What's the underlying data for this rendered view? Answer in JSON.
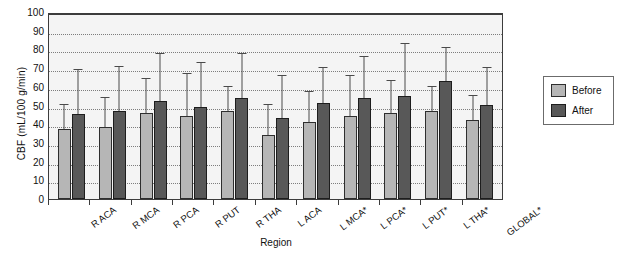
{
  "chart_data": {
    "type": "bar",
    "title": "",
    "xlabel": "Region",
    "ylabel": "CBF (mL/100 g/min)",
    "ylim": [
      0,
      100
    ],
    "ytick_step": 10,
    "yticks": [
      100,
      90,
      80,
      70,
      60,
      50,
      40,
      30,
      20,
      10,
      0
    ],
    "grid": true,
    "legend_position": "right-outside",
    "categories": [
      "R ACA",
      "R MCA",
      "R PCA",
      "R PUT",
      "R THA",
      "L ACA",
      "L MCA*",
      "L PCA*",
      "L PUT*",
      "L THA*",
      "GLOBAL*"
    ],
    "series": [
      {
        "name": "Before",
        "color": "#b6b6b6",
        "values": [
          38,
          39,
          47,
          45,
          48,
          35,
          42,
          45,
          47,
          48,
          43
        ],
        "error_high": [
          51,
          55,
          65,
          68,
          61,
          51,
          58,
          67,
          64,
          61,
          56
        ]
      },
      {
        "name": "After",
        "color": "#585858",
        "values": [
          46,
          48,
          53,
          50,
          55,
          44,
          52,
          55,
          56,
          64,
          51
        ],
        "error_high": [
          70,
          72,
          79,
          74,
          79,
          67,
          71,
          77,
          84,
          82,
          71
        ]
      }
    ]
  },
  "legend": {
    "items": [
      {
        "label": "Before",
        "swatch": "before-swatch"
      },
      {
        "label": "After",
        "swatch": "after-swatch"
      }
    ]
  },
  "axes": {
    "y_title": "CBF (mL/100 g/min)",
    "x_title": "Region"
  },
  "colors": {
    "before_bar": "#b6b6b6",
    "after_bar": "#585858",
    "plot_background": "#f4f4f4",
    "axis": "#3c3c3c",
    "gridline": "#7d7d7d",
    "error_bar": "#4a4a4a"
  }
}
